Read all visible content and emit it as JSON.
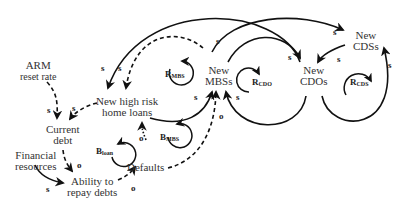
{
  "nodes": {
    "arm": [
      "ARM",
      "reset rate"
    ],
    "loans": [
      "New high risk",
      "home loans"
    ],
    "debt": [
      "Current",
      "debt"
    ],
    "fin": [
      "Financial",
      "resources"
    ],
    "ability": [
      "Ability to",
      "repay debts"
    ],
    "defaults": [
      "Defaults"
    ],
    "mbs": [
      "New",
      "MBSs"
    ],
    "cdo": [
      "New",
      "CDOs"
    ],
    "cds": [
      "New",
      "CDSs"
    ]
  },
  "loops": [
    {
      "id": "R_MBS",
      "letter": "R",
      "sub": "MBS"
    },
    {
      "id": "B_loan",
      "letter": "B",
      "sub": "loan"
    },
    {
      "id": "B_MBS",
      "letter": "B",
      "sub": "MBS"
    },
    {
      "id": "R_CDO",
      "letter": "R",
      "sub": "CDO"
    },
    {
      "id": "R_CDS",
      "letter": "R",
      "sub": "CDS"
    }
  ],
  "polarities": {
    "s": "s",
    "o": "o"
  }
}
